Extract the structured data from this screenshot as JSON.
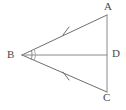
{
  "figure": {
    "kind": "geometry-diagram",
    "background_color": "#ffffff",
    "stroke_color": "#6e6e6e",
    "label_color": "#4a4a4a",
    "labels": {
      "a": "A",
      "b": "B",
      "c": "C",
      "d": "D"
    },
    "points": {
      "A": {
        "x": 107,
        "y": 15
      },
      "B": {
        "x": 22,
        "y": 55
      },
      "C": {
        "x": 107,
        "y": 92
      },
      "D": {
        "x": 107,
        "y": 55
      }
    },
    "segments": [
      {
        "name": "segment-BA",
        "from": "B",
        "to": "A",
        "tick_marks": 1
      },
      {
        "name": "segment-BC",
        "from": "B",
        "to": "C",
        "tick_marks": 1
      },
      {
        "name": "segment-AC",
        "from": "A",
        "to": "C",
        "tick_marks": 0
      },
      {
        "name": "segment-BD",
        "from": "B",
        "to": "D",
        "tick_marks": 0
      }
    ],
    "tick_marks": [
      {
        "name": "tick-on-BA",
        "x": 66,
        "y": 30
      },
      {
        "name": "tick-on-BC",
        "x": 66,
        "y": 76
      }
    ],
    "angle_marks": [
      {
        "name": "angle-arc-ABD",
        "vertex": "B",
        "radius": 10
      },
      {
        "name": "angle-arc-DBC",
        "vertex": "B",
        "radius": 13
      }
    ]
  }
}
